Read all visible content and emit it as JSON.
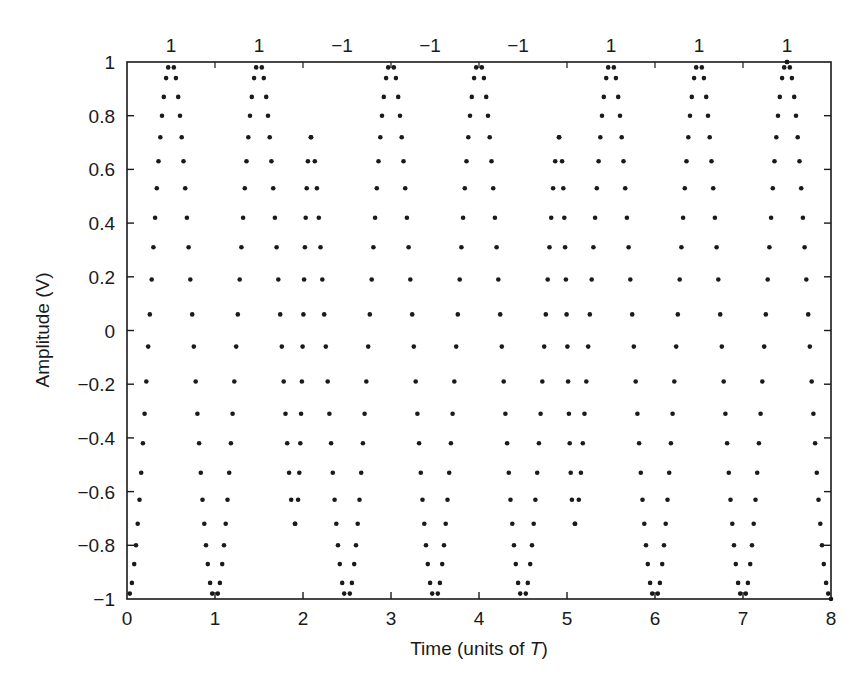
{
  "chart_data": {
    "type": "scatter",
    "title": "",
    "xlabel": "Time (units of ",
    "xlabel_italic": "T",
    "xlabel_end": ")",
    "ylabel": "Amplitude (V)",
    "xlim": [
      0,
      8
    ],
    "ylim": [
      -1,
      1
    ],
    "grid": false,
    "legend": null,
    "x_ticks": [
      0,
      1,
      2,
      3,
      4,
      5,
      6,
      7,
      8
    ],
    "x_tick_labels": [
      "0",
      "1",
      "2",
      "3",
      "4",
      "5",
      "6",
      "7",
      "8"
    ],
    "y_ticks": [
      1,
      0.8,
      0.6,
      0.4,
      0.2,
      0,
      -0.2,
      -0.4,
      -0.6,
      -0.8,
      -1
    ],
    "y_tick_labels": [
      "1",
      "0.8",
      "0.6",
      "0.4",
      "0.2",
      "0",
      "−0.2",
      "−0.4",
      "−0.6",
      "−0.8",
      "−1"
    ],
    "bit_annotations": {
      "positions": [
        0.5,
        1.5,
        2.5,
        3.5,
        4.5,
        5.5,
        6.5,
        7.5
      ],
      "labels": [
        "1",
        "1",
        "−1",
        "−1",
        "−1",
        "1",
        "1",
        "1"
      ],
      "values": [
        1,
        1,
        -1,
        -1,
        -1,
        1,
        1,
        1
      ]
    },
    "series": [
      {
        "name": "sampled waveform",
        "description": "Sinusoid with period T sampled at uniform amplitude levels; phase flips for bits of -1 (transition regions near t=2-3 and t=4-5 show slanted dot trails)",
        "marker": "dot",
        "color": "#1a1a1a",
        "amplitude_levels": [
          1,
          0.98,
          0.94,
          0.87,
          0.8,
          0.72,
          0.63,
          0.53,
          0.42,
          0.31,
          0.19,
          0.06,
          -0.06,
          -0.19,
          -0.31,
          -0.42,
          -0.53,
          -0.63,
          -0.72,
          -0.8,
          -0.87,
          -0.94,
          -0.98,
          -1
        ]
      }
    ]
  },
  "colors": {
    "ink": "#1a1a1a",
    "background": "#ffffff"
  }
}
